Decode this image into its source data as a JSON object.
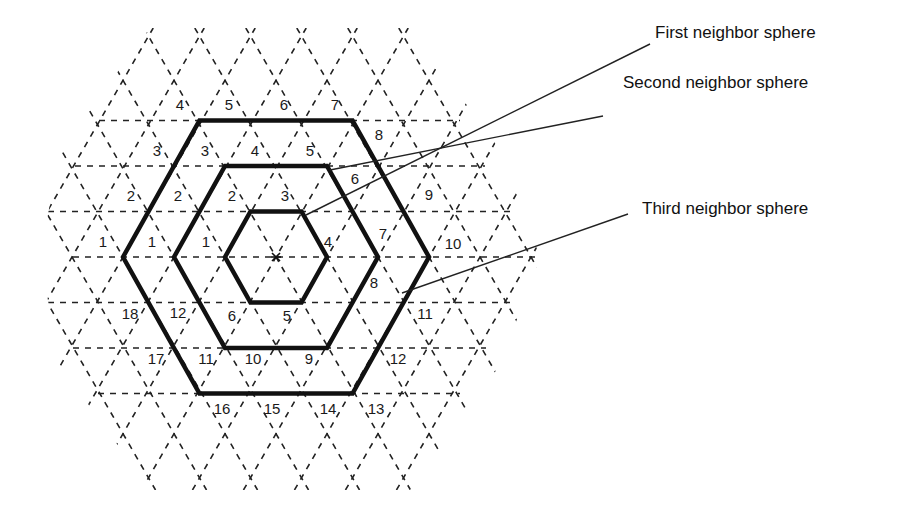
{
  "diagram": {
    "center": {
      "x": 276,
      "y": 257
    },
    "lattice_spacing": 51,
    "row_height": 45.5,
    "colors": {
      "lattice": "#222222",
      "hexagon": "#111111",
      "leader": "#222222",
      "text": "#111111"
    },
    "labels": [
      {
        "id": "first",
        "text": "First neighbor sphere",
        "x": 655,
        "y": 24,
        "line": [
          [
            306,
            215
          ],
          [
            650,
            44
          ]
        ]
      },
      {
        "id": "second",
        "text": "Second neighbor sphere",
        "x": 623,
        "y": 74,
        "line": [
          [
            330,
            170
          ],
          [
            603,
            116
          ]
        ]
      },
      {
        "id": "third",
        "text": "Third neighbor sphere",
        "x": 642,
        "y": 200,
        "line": [
          [
            402,
            293
          ],
          [
            628,
            214
          ]
        ]
      }
    ],
    "shells": [
      {
        "name": "first",
        "radius": 51,
        "numbers": [
          {
            "t": "1",
            "x": 206,
            "y": 241
          },
          {
            "t": "2",
            "x": 232,
            "y": 195
          },
          {
            "t": "3",
            "x": 285,
            "y": 195
          },
          {
            "t": "4",
            "x": 328,
            "y": 241
          },
          {
            "t": "5",
            "x": 287,
            "y": 315
          },
          {
            "t": "6",
            "x": 232,
            "y": 315
          }
        ]
      },
      {
        "name": "second",
        "radius": 102,
        "numbers": [
          {
            "t": "1",
            "x": 152,
            "y": 241
          },
          {
            "t": "2",
            "x": 178,
            "y": 195
          },
          {
            "t": "3",
            "x": 205,
            "y": 150
          },
          {
            "t": "4",
            "x": 255,
            "y": 150
          },
          {
            "t": "5",
            "x": 310,
            "y": 150
          },
          {
            "t": "6",
            "x": 355,
            "y": 178
          },
          {
            "t": "7",
            "x": 383,
            "y": 233
          },
          {
            "t": "8",
            "x": 374,
            "y": 282
          },
          {
            "t": "9",
            "x": 309,
            "y": 358
          },
          {
            "t": "10",
            "x": 253,
            "y": 358
          },
          {
            "t": "11",
            "x": 206,
            "y": 358
          },
          {
            "t": "12",
            "x": 178,
            "y": 312
          }
        ]
      },
      {
        "name": "third",
        "radius": 153,
        "numbers": [
          {
            "t": "1",
            "x": 103,
            "y": 241
          },
          {
            "t": "2",
            "x": 131,
            "y": 195
          },
          {
            "t": "3",
            "x": 157,
            "y": 150
          },
          {
            "t": "4",
            "x": 180,
            "y": 104
          },
          {
            "t": "5",
            "x": 229,
            "y": 104
          },
          {
            "t": "6",
            "x": 284,
            "y": 104
          },
          {
            "t": "7",
            "x": 335,
            "y": 104
          },
          {
            "t": "8",
            "x": 379,
            "y": 134
          },
          {
            "t": "9",
            "x": 429,
            "y": 194
          },
          {
            "t": "10",
            "x": 453,
            "y": 243
          },
          {
            "t": "11",
            "x": 425,
            "y": 313
          },
          {
            "t": "12",
            "x": 398,
            "y": 358
          },
          {
            "t": "13",
            "x": 376,
            "y": 408
          },
          {
            "t": "14",
            "x": 328,
            "y": 408
          },
          {
            "t": "15",
            "x": 272,
            "y": 408
          },
          {
            "t": "16",
            "x": 222,
            "y": 408
          },
          {
            "t": "17",
            "x": 156,
            "y": 358
          },
          {
            "t": "18",
            "x": 130,
            "y": 313
          }
        ]
      }
    ]
  }
}
